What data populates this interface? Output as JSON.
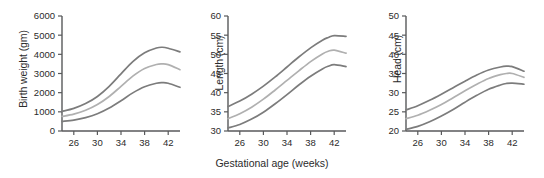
{
  "figure": {
    "xaxis_title": "Gestational age (weeks)",
    "axis_color": "#58595b",
    "text_color": "#2b2b2b",
    "background": "#ffffff",
    "curve_colors": {
      "upper": "#7c7c7c",
      "middle": "#b0b0b0",
      "lower": "#7c7c7c"
    }
  },
  "chart_data": [
    {
      "type": "line",
      "title": "",
      "xlabel": "Gestational age (weeks)",
      "ylabel": "Birth weight (gm)",
      "xlim": [
        24,
        44
      ],
      "ylim": [
        0,
        6000
      ],
      "xticks": [
        26,
        30,
        34,
        38,
        42
      ],
      "xticklabels": [
        "26",
        "30",
        "34",
        "38",
        "42"
      ],
      "yticks": [
        0,
        1000,
        2000,
        3000,
        4000,
        5000,
        6000
      ],
      "yticklabels": [
        "0",
        "1000",
        "2000",
        "3000",
        "4000",
        "5000",
        "6000"
      ],
      "grid": false,
      "legend": "none",
      "x": [
        24,
        26,
        28,
        30,
        32,
        34,
        36,
        38,
        40,
        41,
        42,
        44
      ],
      "series": [
        {
          "name": "upper percentile",
          "values": [
            1020,
            1180,
            1430,
            1800,
            2330,
            2980,
            3620,
            4080,
            4330,
            4370,
            4320,
            4130
          ]
        },
        {
          "name": "middle percentile",
          "values": [
            760,
            880,
            1080,
            1380,
            1800,
            2330,
            2860,
            3260,
            3470,
            3500,
            3460,
            3200
          ]
        },
        {
          "name": "lower percentile",
          "values": [
            500,
            570,
            700,
            900,
            1200,
            1580,
            1990,
            2310,
            2490,
            2520,
            2490,
            2280
          ]
        }
      ]
    },
    {
      "type": "line",
      "title": "",
      "xlabel": "Gestational age (weeks)",
      "ylabel": "Length (cm)",
      "xlim": [
        24,
        44
      ],
      "ylim": [
        30,
        60
      ],
      "xticks": [
        26,
        30,
        34,
        38,
        42
      ],
      "xticklabels": [
        "26",
        "30",
        "34",
        "38",
        "42"
      ],
      "yticks": [
        30,
        35,
        40,
        45,
        50,
        55,
        60
      ],
      "yticklabels": [
        "30",
        "35",
        "40",
        "45",
        "50",
        "55",
        "60"
      ],
      "grid": false,
      "legend": "none",
      "x": [
        24,
        26,
        28,
        30,
        32,
        34,
        36,
        38,
        40,
        41,
        42,
        44
      ],
      "series": [
        {
          "name": "upper percentile",
          "values": [
            36.4,
            37.8,
            39.6,
            41.7,
            44.1,
            46.7,
            49.3,
            51.7,
            53.7,
            54.4,
            54.9,
            54.7
          ]
        },
        {
          "name": "middle percentile",
          "values": [
            33.2,
            34.5,
            36.2,
            38.3,
            40.7,
            43.2,
            45.7,
            48.1,
            50.1,
            50.8,
            51.1,
            50.3
          ]
        },
        {
          "name": "lower percentile",
          "values": [
            30.8,
            31.7,
            33.1,
            34.9,
            37.1,
            39.5,
            42.0,
            44.3,
            46.2,
            46.9,
            47.3,
            46.8
          ]
        }
      ]
    },
    {
      "type": "line",
      "title": "",
      "xlabel": "Gestational age (weeks)",
      "ylabel": "Head (cm)",
      "xlim": [
        24,
        44
      ],
      "ylim": [
        20,
        50
      ],
      "xticks": [
        26,
        30,
        34,
        38,
        42
      ],
      "xticklabels": [
        "26",
        "30",
        "34",
        "38",
        "42"
      ],
      "yticks": [
        20,
        25,
        30,
        35,
        40,
        45,
        50
      ],
      "yticklabels": [
        "20",
        "25",
        "30",
        "35",
        "40",
        "45",
        "50"
      ],
      "grid": false,
      "legend": "none",
      "x": [
        24,
        26,
        28,
        30,
        32,
        34,
        36,
        38,
        40,
        41,
        42,
        44
      ],
      "series": [
        {
          "name": "upper percentile",
          "values": [
            25.5,
            26.6,
            28.0,
            29.6,
            31.3,
            33.0,
            34.6,
            35.9,
            36.7,
            36.9,
            36.8,
            35.6
          ]
        },
        {
          "name": "middle percentile",
          "values": [
            23.2,
            24.1,
            25.4,
            26.9,
            28.7,
            30.5,
            32.2,
            33.7,
            34.7,
            35.0,
            35.0,
            34.0
          ]
        },
        {
          "name": "lower percentile",
          "values": [
            20.4,
            21.2,
            22.4,
            23.9,
            25.6,
            27.5,
            29.3,
            30.9,
            32.0,
            32.4,
            32.5,
            32.2
          ]
        }
      ]
    }
  ]
}
